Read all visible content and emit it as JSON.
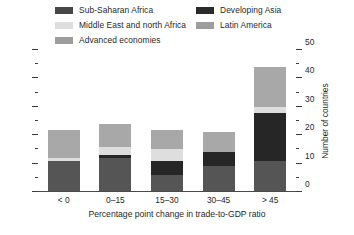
{
  "chart_data": {
    "type": "bar",
    "subtype": "stacked-bar",
    "title": "",
    "xlabel": "Percentage point change in trade-to-GDP ratio",
    "ylabel": "Number of countries",
    "categories": [
      "< 0",
      "0–15",
      "15–30",
      "30–45",
      "> 45"
    ],
    "ylim": [
      0,
      50
    ],
    "y_ticks_major": [
      0,
      10,
      20,
      30,
      40,
      50
    ],
    "y_ticks_minor": [
      5,
      15,
      25,
      35,
      45
    ],
    "y_axis_position": "right",
    "grid": false,
    "legend_position": "top",
    "series": [
      {
        "name": "Sub-Saharan Africa",
        "color": "#555555",
        "values": [
          11,
          12,
          6,
          9,
          11
        ]
      },
      {
        "name": "Developing Asia",
        "color": "#262626",
        "values": [
          0,
          1,
          5,
          5,
          17
        ]
      },
      {
        "name": "Middle East and north Africa",
        "color": "#dedede",
        "values": [
          1,
          3,
          4,
          0,
          2
        ]
      },
      {
        "name": "Latin America",
        "color": "#9a9a9a",
        "values": [
          0,
          0,
          0,
          0,
          0
        ]
      },
      {
        "name": "Advanced economies",
        "color": "#a8a8a8",
        "values": [
          10,
          8,
          7,
          7,
          14
        ]
      }
    ],
    "totals": [
      22,
      24,
      22,
      21,
      44
    ]
  },
  "legend": {
    "columns": [
      {
        "items": [
          {
            "label": "Sub-Saharan Africa",
            "color": "#474747"
          },
          {
            "label": "Middle East and north Africa",
            "color": "#dedede"
          },
          {
            "label": "Advanced economies",
            "color": "#9d9d9d"
          }
        ]
      },
      {
        "items": [
          {
            "label": "Developing Asia",
            "color": "#2b2b2b"
          },
          {
            "label": "Latin America",
            "color": "#9d9d9d"
          }
        ]
      }
    ]
  },
  "axes": {
    "right": {
      "title": "Number of countries",
      "tick_labels": [
        "50",
        "40",
        "30",
        "20",
        "10",
        "0"
      ]
    },
    "bottom": {
      "title": "Percentage point change in trade-to-GDP ratio",
      "tick_labels": [
        "< 0",
        "0–15",
        "15–30",
        "30–45",
        "> 45"
      ]
    }
  },
  "colors": {
    "sub_saharan_africa": "#555555",
    "developing_asia": "#262626",
    "middle_east_north_africa": "#dedede",
    "latin_america": "#9a9a9a",
    "advanced_economies": "#a8a8a8",
    "axis": "#4a4a4a",
    "text": "#1f1f1f",
    "background": "#ffffff"
  }
}
